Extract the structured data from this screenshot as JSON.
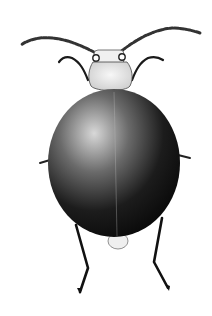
{
  "image": {
    "subject": "beetle illustration",
    "background": "#ffffff",
    "colors": {
      "body_dark": "#111111",
      "body_mid": "#555555",
      "highlight": "#e6e6e6",
      "outline": "#222222"
    }
  }
}
